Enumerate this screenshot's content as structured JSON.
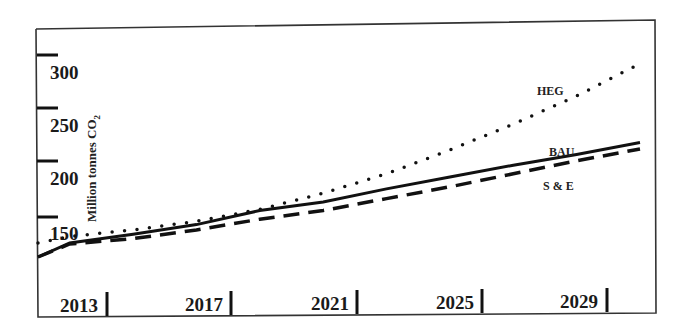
{
  "chart_data": {
    "type": "line",
    "title": "",
    "xlabel": "",
    "ylabel": "Million tonnes CO2",
    "ylabel_display": "Million tonnes CO",
    "ylabel_subscript": "2",
    "x": [
      2012,
      2013,
      2015,
      2017,
      2019,
      2021,
      2023,
      2025,
      2027,
      2029,
      2031
    ],
    "series": [
      {
        "name": "HEG",
        "style": "dotted",
        "values": [
          126,
          132,
          138,
          146,
          157,
          172,
          190,
          212,
          236,
          262,
          292
        ]
      },
      {
        "name": "BAU",
        "style": "solid",
        "values": [
          113,
          126,
          134,
          143,
          156,
          164,
          176,
          187,
          198,
          208,
          219
        ]
      },
      {
        "name": "S & E",
        "style": "dashed",
        "values": [
          113,
          125,
          130,
          138,
          148,
          156,
          167,
          178,
          190,
          202,
          213
        ]
      }
    ],
    "x_tick_labels": [
      "2013",
      "2017",
      "2021",
      "2025",
      "2029"
    ],
    "y_tick_labels": [
      "300",
      "250",
      "200",
      "150"
    ],
    "ylim": [
      105,
      320
    ],
    "grid": false,
    "legend": "inline labels"
  },
  "labels": {
    "heg": "HEG",
    "bau": "BAU",
    "se": "S & E"
  }
}
